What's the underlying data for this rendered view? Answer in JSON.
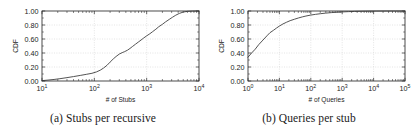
{
  "figure": {
    "background": "#ffffff",
    "curve_color": "#4a4a4a",
    "axis_color": "#2b2b2b",
    "grid_color": "#c8c8c8"
  },
  "panels": [
    {
      "id": "a",
      "caption": "(a) Stubs per recursive",
      "xlabel": "# of Stubs",
      "ylabel": "CDF"
    },
    {
      "id": "b",
      "caption": "(b) Queries per stub",
      "xlabel": "# of Queries",
      "ylabel": "CDF"
    }
  ],
  "y_ticks": [
    "0.00",
    "0.20",
    "0.40",
    "0.60",
    "0.80",
    "1.00"
  ],
  "x_ticks_a": [
    "1",
    "2",
    "3",
    "4"
  ],
  "x_ticks_b": [
    "0",
    "1",
    "2",
    "3",
    "4",
    "5"
  ],
  "mantissa": "10",
  "chart_data": [
    {
      "type": "line",
      "id": "a",
      "title": "(a) Stubs per recursive",
      "xlabel": "# of Stubs",
      "ylabel": "CDF",
      "xscale": "log",
      "xlim": [
        10,
        10000
      ],
      "ylim": [
        0.0,
        1.0
      ],
      "grid": true,
      "legend": "none",
      "xtick_labels": [
        "10^1",
        "10^2",
        "10^3",
        "10^4"
      ],
      "ytick_labels": [
        "0.00",
        "0.20",
        "0.40",
        "0.60",
        "0.80",
        "1.00"
      ],
      "series": [
        {
          "name": "Stubs per recursive CDF",
          "x": [
            10,
            13,
            17,
            22,
            30,
            40,
            55,
            70,
            90,
            110,
            130,
            150,
            175,
            200,
            230,
            260,
            300,
            340,
            380,
            430,
            480,
            540,
            610,
            690,
            780,
            880,
            1000,
            1150,
            1300,
            1500,
            1700,
            2000,
            2300,
            2700,
            3100,
            3600,
            4200,
            5000,
            6000,
            7500,
            10000
          ],
          "y": [
            0.005,
            0.013,
            0.022,
            0.033,
            0.048,
            0.063,
            0.081,
            0.095,
            0.11,
            0.13,
            0.155,
            0.185,
            0.225,
            0.27,
            0.315,
            0.35,
            0.385,
            0.405,
            0.42,
            0.44,
            0.465,
            0.495,
            0.525,
            0.555,
            0.585,
            0.615,
            0.645,
            0.675,
            0.705,
            0.74,
            0.775,
            0.81,
            0.845,
            0.88,
            0.91,
            0.94,
            0.965,
            0.985,
            0.995,
            0.999,
            1.0
          ]
        }
      ]
    },
    {
      "type": "line",
      "id": "b",
      "title": "(b) Queries per stub",
      "xlabel": "# of Queries",
      "ylabel": "CDF",
      "xscale": "log",
      "xlim": [
        1,
        100000
      ],
      "ylim": [
        0.0,
        1.0
      ],
      "grid": true,
      "legend": "none",
      "xtick_labels": [
        "10^0",
        "10^1",
        "10^2",
        "10^3",
        "10^4",
        "10^5"
      ],
      "ytick_labels": [
        "0.00",
        "0.20",
        "0.40",
        "0.60",
        "0.80",
        "1.00"
      ],
      "series": [
        {
          "name": "Queries per stub CDF",
          "x": [
            1,
            1.3,
            1.7,
            2.2,
            3,
            4,
            5,
            6.5,
            8,
            10,
            13,
            17,
            22,
            30,
            40,
            55,
            70,
            100,
            140,
            200,
            300,
            450,
            700,
            1000,
            1600,
            2500,
            4000,
            7000,
            12000,
            25000,
            50000,
            100000
          ],
          "y": [
            0.34,
            0.4,
            0.455,
            0.52,
            0.585,
            0.645,
            0.69,
            0.725,
            0.755,
            0.785,
            0.815,
            0.84,
            0.862,
            0.882,
            0.9,
            0.917,
            0.928,
            0.942,
            0.952,
            0.961,
            0.97,
            0.977,
            0.983,
            0.987,
            0.991,
            0.994,
            0.996,
            0.998,
            0.999,
            0.9995,
            0.9999,
            1.0
          ]
        }
      ]
    }
  ]
}
